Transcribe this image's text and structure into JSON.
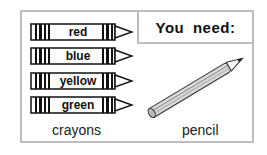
{
  "header": {
    "title": "You need:"
  },
  "crayons": {
    "items": [
      {
        "label": "red"
      },
      {
        "label": "blue"
      },
      {
        "label": "yellow"
      },
      {
        "label": "green"
      }
    ],
    "caption": "crayons"
  },
  "pencil": {
    "caption": "pencil"
  },
  "colors": {
    "border": "#bdbdbd",
    "ink": "#111111"
  }
}
